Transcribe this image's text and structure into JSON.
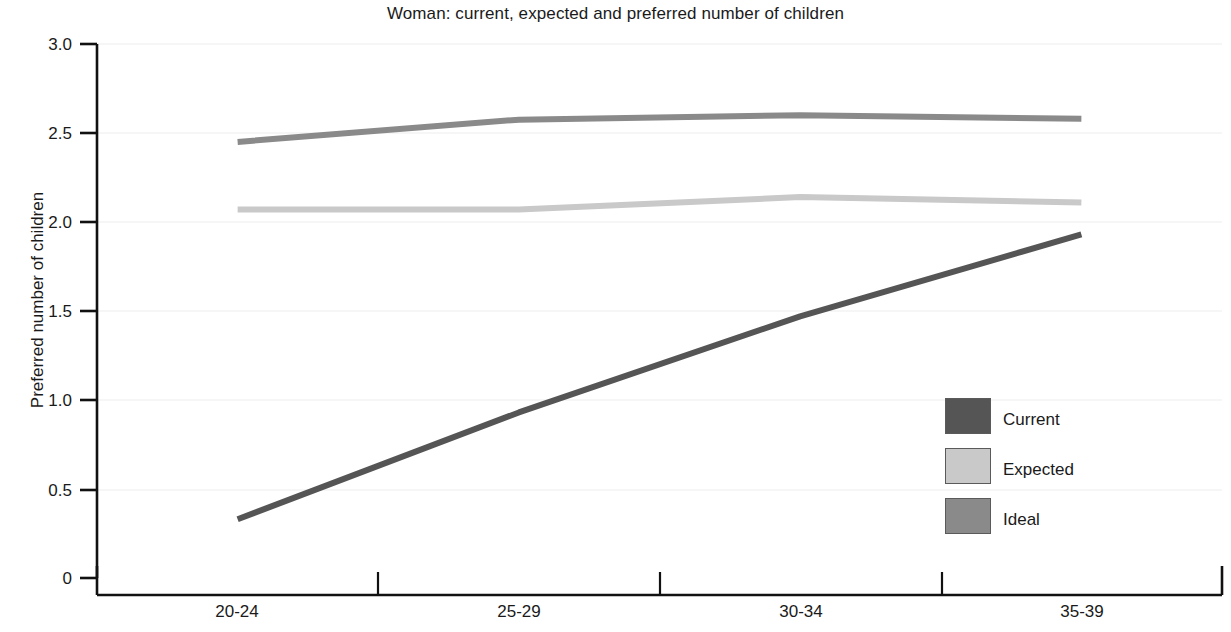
{
  "chart_data": {
    "type": "line",
    "title": "Woman: current, expected and preferred number of children",
    "xlabel": "",
    "ylabel": "Preferred number of children",
    "categories": [
      "20-24",
      "25-29",
      "30-34",
      "35-39"
    ],
    "ylim": [
      0,
      3.0
    ],
    "ytick_labels": [
      "0",
      "0.5",
      "1.0",
      "1.5",
      "2.0",
      "2.5",
      "3.0"
    ],
    "ytick_values": [
      0,
      0.5,
      1.0,
      1.5,
      2.0,
      2.5,
      3.0
    ],
    "grid": true,
    "grid_axis": "y",
    "legend_position": "inside-right-lower",
    "series": [
      {
        "name": "Current",
        "color": "#555555",
        "values": [
          0.33,
          0.93,
          1.47,
          1.93
        ]
      },
      {
        "name": "Expected",
        "color": "#c9c9c9",
        "values": [
          2.07,
          2.07,
          2.14,
          2.11
        ]
      },
      {
        "name": "Ideal",
        "color": "#8a8a8a",
        "values": [
          2.45,
          2.575,
          2.6,
          2.58
        ]
      }
    ]
  },
  "axes": {
    "y_axis_title": "Preferred number of children",
    "y_ticks": [
      {
        "label": "3.0",
        "value": 3.0
      },
      {
        "label": "2.5",
        "value": 2.5
      },
      {
        "label": "2.0",
        "value": 2.0
      },
      {
        "label": "1.5",
        "value": 1.5
      },
      {
        "label": "1.0",
        "value": 1.0
      },
      {
        "label": "0.5",
        "value": 0.5
      },
      {
        "label": "0",
        "value": 0
      }
    ],
    "x_ticks": [
      {
        "label": "20-24"
      },
      {
        "label": "25-29"
      },
      {
        "label": "30-34"
      },
      {
        "label": "35-39"
      }
    ]
  },
  "legend": {
    "items": [
      {
        "label": "Current",
        "color": "#555555"
      },
      {
        "label": "Expected",
        "color": "#c9c9c9"
      },
      {
        "label": "Ideal",
        "color": "#8a8a8a"
      }
    ]
  },
  "colors": {
    "background": "#ffffff",
    "axis": "#111111",
    "grid": "#eeeeee",
    "text": "#1a1a1a",
    "current": "#555555",
    "expected": "#c9c9c9",
    "ideal": "#8a8a8a"
  }
}
